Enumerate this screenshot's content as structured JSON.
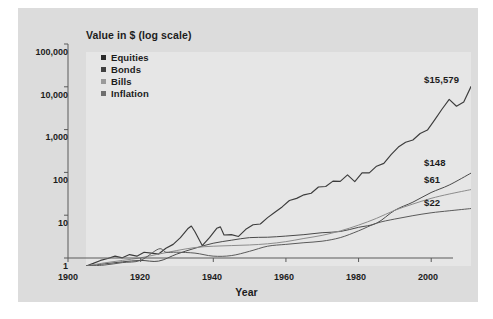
{
  "chart_data": {
    "type": "line",
    "title": "Value in $ (log scale)",
    "ylabel": "Value in $ (log scale)",
    "xlabel": "Year",
    "xlim": [
      1900,
      2006
    ],
    "ylim": [
      1,
      100000
    ],
    "yscale": "log",
    "grid": false,
    "legend_position": "top-left inside plot",
    "xticks": [
      1900,
      1920,
      1940,
      1960,
      1980,
      2000
    ],
    "xticklabels": [
      "1900",
      "1920",
      "1940",
      "1960",
      "1980",
      "2000"
    ],
    "yticks": [
      1,
      10,
      100,
      1000,
      10000,
      100000
    ],
    "yticklabels": [
      "1",
      "10",
      "100",
      "1,000",
      "10,000",
      "100,000"
    ],
    "series": [
      {
        "name": "Equities",
        "color": "#3c3c3c",
        "end_label": "$15,579",
        "end_value": 15579,
        "x": [
          1900,
          1902,
          1904,
          1906,
          1908,
          1910,
          1912,
          1914,
          1916,
          1918,
          1920,
          1922,
          1924,
          1926,
          1928,
          1929,
          1930,
          1932,
          1934,
          1936,
          1937,
          1938,
          1940,
          1942,
          1944,
          1946,
          1948,
          1950,
          1952,
          1954,
          1956,
          1958,
          1960,
          1962,
          1964,
          1966,
          1968,
          1970,
          1972,
          1974,
          1976,
          1978,
          1980,
          1982,
          1984,
          1986,
          1988,
          1990,
          1992,
          1994,
          1996,
          1998,
          2000,
          2002,
          2004,
          2006
        ],
        "y": [
          1.0,
          1.15,
          1.35,
          1.5,
          1.7,
          1.55,
          1.85,
          1.7,
          2.1,
          2.0,
          1.9,
          2.6,
          3.2,
          4.6,
          7.4,
          8.6,
          6.3,
          3.0,
          4.6,
          7.6,
          8.2,
          5.3,
          5.4,
          4.9,
          7.2,
          9.2,
          9.6,
          13.5,
          18,
          24,
          34,
          38,
          46,
          50,
          70,
          72,
          96,
          95,
          135,
          94,
          150,
          150,
          215,
          250,
          400,
          600,
          780,
          880,
          1250,
          1500,
          2600,
          4600,
          7800,
          5400,
          6800,
          15579
        ]
      },
      {
        "name": "Bonds",
        "color": "#4a4a4a",
        "end_label": "$148",
        "end_value": 148,
        "x": [
          1900,
          1905,
          1910,
          1915,
          1920,
          1925,
          1930,
          1935,
          1940,
          1945,
          1950,
          1955,
          1960,
          1965,
          1970,
          1975,
          1980,
          1985,
          1990,
          1995,
          2000,
          2006
        ],
        "y": [
          1.0,
          1.12,
          1.25,
          1.35,
          1.3,
          1.9,
          2.6,
          3.4,
          4.0,
          4.6,
          4.7,
          5.0,
          5.4,
          6.0,
          6.4,
          8.0,
          10.0,
          20,
          31,
          52,
          78,
          148
        ]
      },
      {
        "name": "Bills",
        "color": "#8c8c8c",
        "end_label": "$61",
        "end_value": 61,
        "x": [
          1900,
          1905,
          1910,
          1915,
          1920,
          1925,
          1930,
          1935,
          1940,
          1945,
          1950,
          1955,
          1960,
          1965,
          1970,
          1975,
          1980,
          1985,
          1990,
          1995,
          2000,
          2006
        ],
        "y": [
          1.0,
          1.18,
          1.35,
          1.55,
          1.9,
          2.3,
          2.7,
          2.9,
          3.0,
          3.1,
          3.3,
          3.7,
          4.4,
          5.2,
          6.6,
          9.0,
          13,
          20,
          28,
          38,
          48,
          61
        ]
      },
      {
        "name": "Inflation",
        "color": "#5a5a5a",
        "end_label": "$22",
        "end_value": 22,
        "x": [
          1900,
          1905,
          1910,
          1915,
          1920,
          1922,
          1925,
          1930,
          1935,
          1940,
          1945,
          1950,
          1955,
          1960,
          1965,
          1970,
          1975,
          1980,
          1985,
          1990,
          1995,
          2000,
          2006
        ],
        "y": [
          1.0,
          1.05,
          1.2,
          1.35,
          2.5,
          2.1,
          2.1,
          2.0,
          1.7,
          1.75,
          2.2,
          2.9,
          3.2,
          3.5,
          3.8,
          4.6,
          6.6,
          10.0,
          12.5,
          15.0,
          17.5,
          19.5,
          22
        ]
      }
    ]
  },
  "legend": {
    "items": [
      {
        "label": "Equities",
        "color": "#2b2b2b"
      },
      {
        "label": "Bonds",
        "color": "#3f3f3f"
      },
      {
        "label": "Bills",
        "color": "#9a9a9a"
      },
      {
        "label": "Inflation",
        "color": "#6e6e6e"
      }
    ]
  },
  "axes": {
    "y_title": "Value in $ (log scale)",
    "x_title": "Year",
    "y_labels": [
      "100,000",
      "10,000",
      "1,000",
      "100",
      "10",
      "1"
    ],
    "x_labels": [
      "1900",
      "1920",
      "1940",
      "1960",
      "1980",
      "2000"
    ]
  },
  "end_labels": [
    {
      "text": "$15,579"
    },
    {
      "text": "$148"
    },
    {
      "text": "$61"
    },
    {
      "text": "$22"
    }
  ],
  "colors": {
    "page_background": "#ffffff",
    "panel_background": "#dcdcdc",
    "plot_background": "#e6e6e6",
    "axis": "#5a5a5a",
    "text": "#1c1c1c"
  }
}
